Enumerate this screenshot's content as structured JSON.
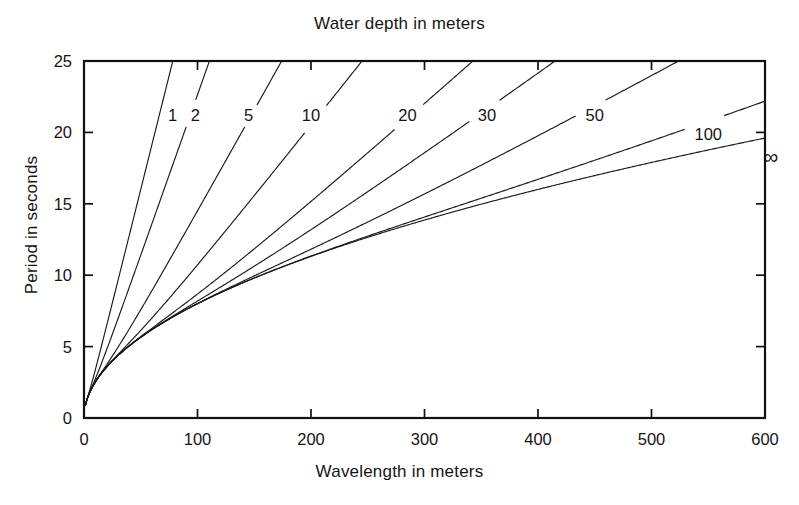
{
  "chart_data": {
    "type": "line",
    "title": "Water depth in meters",
    "xlabel": "Wavelength in meters",
    "ylabel": "Period in seconds",
    "xlim": [
      0,
      600
    ],
    "ylim": [
      0,
      25
    ],
    "xticks": [
      0,
      100,
      200,
      300,
      400,
      500,
      600
    ],
    "yticks": [
      0,
      5,
      10,
      15,
      20,
      25
    ],
    "grid": false,
    "legend": "inline-curve-labels",
    "relation": "T = sqrt(2*pi*L / (g*tanh(2*pi*d/L)))",
    "series": [
      {
        "name": "1",
        "depth_m": 1,
        "label": "1",
        "label_xy": [
          78,
          21.2
        ],
        "x": [
          5,
          20,
          40,
          60,
          80,
          100,
          120,
          140,
          160,
          180,
          200
        ],
        "y": [
          2.1,
          4.5,
          6.4,
          7.8,
          9.0,
          10.1,
          11.0,
          11.9,
          12.8,
          13.5,
          14.3
        ]
      },
      {
        "name": "2",
        "depth_m": 2,
        "label": "2",
        "label_xy": [
          98,
          21.2
        ],
        "x": [
          5,
          20,
          40,
          60,
          80,
          100,
          130,
          160,
          200,
          240,
          280
        ],
        "y": [
          1.8,
          3.4,
          4.7,
          5.7,
          6.5,
          7.2,
          8.2,
          9.1,
          10.2,
          11.2,
          12.1
        ]
      },
      {
        "name": "5",
        "depth_m": 5,
        "label": "5",
        "label_xy": [
          145,
          21.2
        ],
        "x": [
          5,
          20,
          40,
          70,
          100,
          140,
          180,
          240,
          300,
          380,
          460
        ],
        "y": [
          1.8,
          3.2,
          4.1,
          5.0,
          5.8,
          6.7,
          7.5,
          8.6,
          9.6,
          10.8,
          11.9
        ]
      },
      {
        "name": "10",
        "depth_m": 10,
        "label": "10",
        "label_xy": [
          200,
          21.2
        ],
        "x": [
          5,
          20,
          50,
          80,
          120,
          170,
          230,
          300,
          400,
          500,
          600
        ],
        "y": [
          1.8,
          3.2,
          4.6,
          5.5,
          6.4,
          7.3,
          8.3,
          9.3,
          10.5,
          11.6,
          12.6
        ]
      },
      {
        "name": "20",
        "depth_m": 20,
        "label": "20",
        "label_xy": [
          285,
          21.2
        ],
        "x": [
          5,
          20,
          50,
          90,
          140,
          200,
          270,
          350,
          450,
          550,
          600
        ],
        "y": [
          1.8,
          3.2,
          5.0,
          6.4,
          7.5,
          8.6,
          9.6,
          10.6,
          11.7,
          12.7,
          13.2
        ]
      },
      {
        "name": "30",
        "depth_m": 30,
        "label": "30",
        "label_xy": [
          355,
          21.2
        ],
        "x": [
          5,
          20,
          50,
          100,
          160,
          230,
          310,
          400,
          500,
          600
        ],
        "y": [
          1.8,
          3.2,
          5.1,
          6.9,
          8.2,
          9.4,
          10.5,
          11.6,
          12.7,
          13.7
        ]
      },
      {
        "name": "50",
        "depth_m": 50,
        "label": "50",
        "label_xy": [
          450,
          21.2
        ],
        "x": [
          5,
          20,
          50,
          100,
          170,
          250,
          340,
          440,
          550,
          600
        ],
        "y": [
          1.8,
          3.2,
          5.1,
          7.2,
          9.0,
          10.5,
          11.8,
          13.0,
          14.3,
          14.8
        ]
      },
      {
        "name": "100",
        "depth_m": 100,
        "label": "100",
        "label_xy": [
          550,
          19.9
        ],
        "x": [
          5,
          20,
          50,
          100,
          180,
          270,
          370,
          480,
          600
        ],
        "y": [
          1.8,
          3.2,
          5.1,
          7.3,
          9.6,
          11.5,
          13.2,
          14.9,
          16.6
        ]
      },
      {
        "name": "infinite",
        "depth_m": null,
        "label": "∞",
        "label_xy": [
          605,
          18.3
        ],
        "x": [
          5,
          20,
          50,
          100,
          180,
          280,
          400,
          500,
          600
        ],
        "y": [
          1.8,
          3.6,
          5.7,
          8.0,
          10.7,
          13.4,
          16.0,
          17.9,
          19.6
        ]
      }
    ]
  }
}
